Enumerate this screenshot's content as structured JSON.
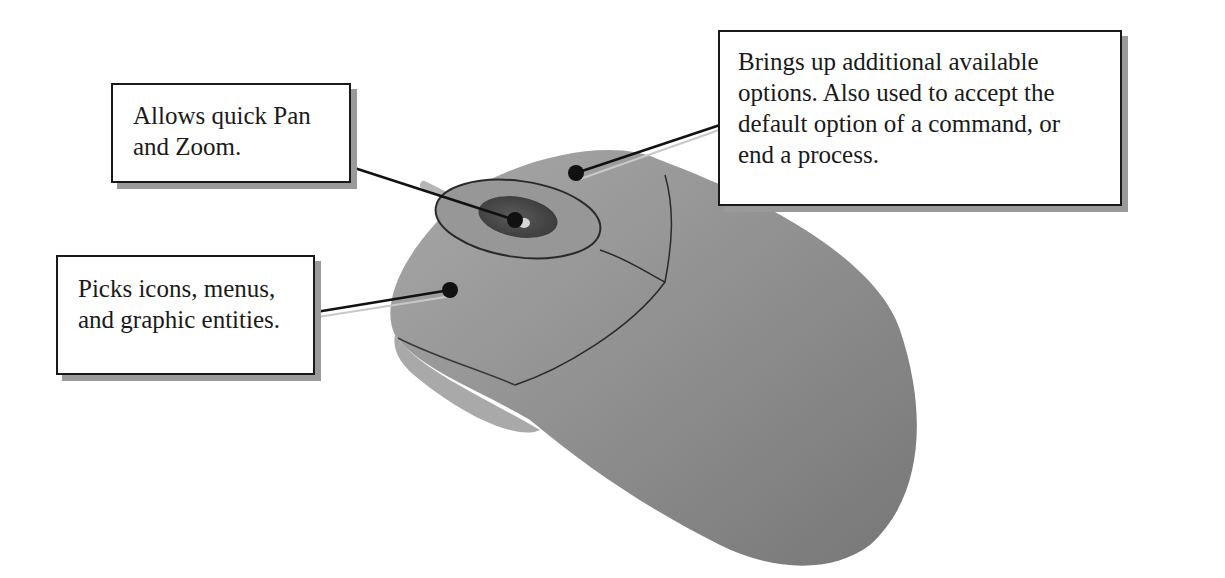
{
  "diagram": {
    "callouts": [
      {
        "id": "wheel",
        "target": "middle-button-scroll-wheel",
        "lines": [
          "Allows quick Pan",
          "and Zoom."
        ]
      },
      {
        "id": "right",
        "target": "right-mouse-button",
        "lines": [
          "Brings up additional available",
          "options. Also used to accept the",
          "default option of a command, or",
          "end a process."
        ]
      },
      {
        "id": "left",
        "target": "left-mouse-button",
        "lines": [
          "Picks icons, menus,",
          "and graphic entities."
        ]
      }
    ]
  },
  "colors": {
    "body": "#8c8c8c",
    "body_light": "#a6a6a6",
    "body_dark": "#6f6f6f",
    "wheel": "#4a4a4a",
    "line": "#111111",
    "shadow": "#9a9a9a"
  }
}
